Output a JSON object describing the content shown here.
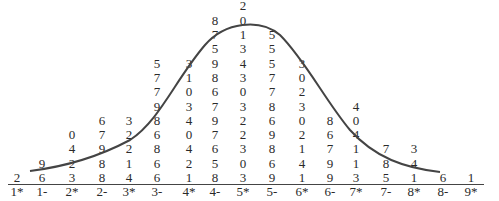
{
  "chart_data": {
    "type": "stem-and-leaf",
    "title": "",
    "orientation": "vertical (stems along bottom, leaves stacked upward)",
    "overlay": "normal curve",
    "stems": [
      "1*",
      "1-",
      "2*",
      "2-",
      "3*",
      "3-",
      "4*",
      "4-",
      "5*",
      "5-",
      "6*",
      "6-",
      "7*",
      "7-",
      "8*",
      "8-",
      "9*"
    ],
    "leaves": [
      [
        "2"
      ],
      [
        "6",
        "9"
      ],
      [
        "3",
        "2",
        "4",
        "0"
      ],
      [
        "8",
        "8",
        "9",
        "7",
        "6"
      ],
      [
        "4",
        "1",
        "2",
        "2",
        "3"
      ],
      [
        "6",
        "6",
        "8",
        "6",
        "8",
        "9",
        "7",
        "7",
        "5"
      ],
      [
        "1",
        "2",
        "4",
        "0",
        "4",
        "3",
        "0",
        "1",
        "3"
      ],
      [
        "8",
        "5",
        "6",
        "7",
        "9",
        "7",
        "6",
        "8",
        "9",
        "5",
        "7",
        "8"
      ],
      [
        "3",
        "0",
        "3",
        "2",
        "2",
        "3",
        "0",
        "3",
        "4",
        "3",
        "1",
        "0",
        "2",
        "4"
      ],
      [
        "9",
        "6",
        "8",
        "9",
        "6",
        "8",
        "7",
        "7",
        "5",
        "5",
        "5"
      ],
      [
        "1",
        "4",
        "1",
        "2",
        "0",
        "3",
        "2",
        "0",
        "3"
      ],
      [
        "9",
        "9",
        "7",
        "6",
        "8"
      ],
      [
        "3",
        "1",
        "1",
        "4",
        "0",
        "4"
      ],
      [
        "5",
        "8",
        "7"
      ],
      [
        "1",
        "4",
        "3"
      ],
      [
        "6"
      ],
      [
        "1"
      ]
    ],
    "counts": [
      1,
      2,
      4,
      5,
      5,
      9,
      9,
      12,
      14,
      11,
      9,
      5,
      6,
      3,
      3,
      1,
      1
    ],
    "xlabel": "",
    "ylabel": ""
  }
}
